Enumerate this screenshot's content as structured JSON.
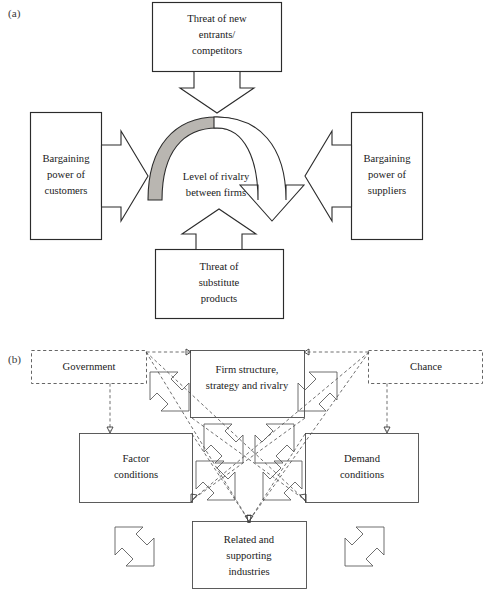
{
  "figure": {
    "panels": [
      {
        "id": "a",
        "letter": "(a)",
        "name": "five-forces-diagram",
        "nodes": [
          {
            "id": "new-entrants",
            "lines": [
              "Threat of new",
              "entrants/",
              "competitors"
            ]
          },
          {
            "id": "bargaining-customers",
            "lines": [
              "Bargaining",
              "power of",
              "customers"
            ]
          },
          {
            "id": "rivalry",
            "lines": [
              "Level of rivalry",
              "between firms"
            ]
          },
          {
            "id": "bargaining-suppliers",
            "lines": [
              "Bargaining",
              "power of",
              "suppliers"
            ]
          },
          {
            "id": "substitutes",
            "lines": [
              "Threat of",
              "substitute",
              "products"
            ]
          }
        ]
      },
      {
        "id": "b",
        "letter": "(b)",
        "name": "porter-diamond-diagram",
        "nodes": [
          {
            "id": "government",
            "lines": [
              "Government"
            ],
            "style": "dashed"
          },
          {
            "id": "firm-structure",
            "lines": [
              "Firm structure,",
              "strategy and rivalry"
            ],
            "style": "solid"
          },
          {
            "id": "chance",
            "lines": [
              "Chance"
            ],
            "style": "dashed"
          },
          {
            "id": "factor-conditions",
            "lines": [
              "Factor",
              "conditions"
            ],
            "style": "solid"
          },
          {
            "id": "demand-conditions",
            "lines": [
              "Demand",
              "conditions"
            ],
            "style": "solid"
          },
          {
            "id": "related-industries",
            "lines": [
              "Related and",
              "supporting",
              "industries"
            ],
            "style": "solid"
          }
        ]
      }
    ],
    "colors": {
      "ink": "#2b2b2b",
      "gray_fill": "#b9b6b1",
      "dashed_stroke": "#555555",
      "paper": "#ffffff"
    }
  }
}
